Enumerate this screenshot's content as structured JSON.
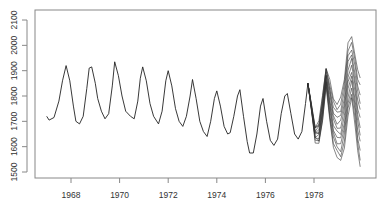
{
  "chart_data": {
    "type": "line",
    "title": "",
    "xlabel": "",
    "ylabel": "",
    "xlim": [
      1966.5,
      1980.3
    ],
    "ylim": [
      1500,
      2100
    ],
    "grid": false,
    "legend": null,
    "x_ticks": [
      "1968",
      "1970",
      "1972",
      "1974",
      "1976",
      "1978"
    ],
    "y_ticks": [
      "1500",
      "1600",
      "1700",
      "1800",
      "1900",
      "2000",
      "2100"
    ],
    "series": [
      {
        "name": "observed",
        "points": [
          [
            1967.0,
            1720
          ],
          [
            1967.1,
            1705
          ],
          [
            1967.3,
            1715
          ],
          [
            1967.5,
            1780
          ],
          [
            1967.65,
            1860
          ],
          [
            1967.8,
            1920
          ],
          [
            1967.95,
            1860
          ],
          [
            1968.1,
            1760
          ],
          [
            1968.2,
            1700
          ],
          [
            1968.35,
            1690
          ],
          [
            1968.5,
            1720
          ],
          [
            1968.65,
            1830
          ],
          [
            1968.75,
            1910
          ],
          [
            1968.85,
            1915
          ],
          [
            1969.0,
            1850
          ],
          [
            1969.1,
            1790
          ],
          [
            1969.25,
            1740
          ],
          [
            1969.4,
            1710
          ],
          [
            1969.55,
            1730
          ],
          [
            1969.7,
            1840
          ],
          [
            1969.8,
            1935
          ],
          [
            1969.95,
            1880
          ],
          [
            1970.1,
            1800
          ],
          [
            1970.25,
            1740
          ],
          [
            1970.45,
            1720
          ],
          [
            1970.6,
            1710
          ],
          [
            1970.75,
            1780
          ],
          [
            1970.85,
            1870
          ],
          [
            1970.95,
            1915
          ],
          [
            1971.1,
            1860
          ],
          [
            1971.25,
            1770
          ],
          [
            1971.4,
            1720
          ],
          [
            1971.6,
            1690
          ],
          [
            1971.75,
            1740
          ],
          [
            1971.9,
            1860
          ],
          [
            1972.0,
            1900
          ],
          [
            1972.15,
            1840
          ],
          [
            1972.3,
            1750
          ],
          [
            1972.45,
            1700
          ],
          [
            1972.6,
            1680
          ],
          [
            1972.75,
            1720
          ],
          [
            1972.9,
            1800
          ],
          [
            1973.0,
            1865
          ],
          [
            1973.15,
            1790
          ],
          [
            1973.3,
            1700
          ],
          [
            1973.45,
            1660
          ],
          [
            1973.6,
            1640
          ],
          [
            1973.75,
            1700
          ],
          [
            1973.9,
            1790
          ],
          [
            1974.0,
            1820
          ],
          [
            1974.15,
            1760
          ],
          [
            1974.3,
            1680
          ],
          [
            1974.45,
            1650
          ],
          [
            1974.55,
            1655
          ],
          [
            1974.7,
            1720
          ],
          [
            1974.85,
            1800
          ],
          [
            1974.95,
            1825
          ],
          [
            1975.1,
            1720
          ],
          [
            1975.25,
            1620
          ],
          [
            1975.35,
            1575
          ],
          [
            1975.5,
            1575
          ],
          [
            1975.65,
            1650
          ],
          [
            1975.8,
            1760
          ],
          [
            1975.9,
            1790
          ],
          [
            1976.05,
            1700
          ],
          [
            1976.2,
            1625
          ],
          [
            1976.35,
            1605
          ],
          [
            1976.5,
            1630
          ],
          [
            1976.65,
            1730
          ],
          [
            1976.8,
            1800
          ],
          [
            1976.9,
            1810
          ],
          [
            1977.05,
            1730
          ],
          [
            1977.2,
            1650
          ],
          [
            1977.35,
            1630
          ],
          [
            1977.5,
            1660
          ],
          [
            1977.65,
            1770
          ],
          [
            1977.75,
            1850
          ]
        ]
      }
    ],
    "forecast_fan": {
      "start_year": 1977.75,
      "start_value": 1850,
      "n_paths": 12,
      "x": [
        1977.75,
        1977.9,
        1978.05,
        1978.2,
        1978.35,
        1978.5,
        1978.65,
        1978.8,
        1978.95,
        1979.1,
        1979.25,
        1979.4,
        1979.55,
        1979.7,
        1979.8,
        1979.9
      ],
      "upper": [
        1850,
        1760,
        1680,
        1700,
        1800,
        1915,
        1860,
        1790,
        1770,
        1790,
        1870,
        2010,
        2030,
        1960,
        1900,
        1870
      ],
      "lower": [
        1850,
        1740,
        1620,
        1610,
        1700,
        1840,
        1700,
        1600,
        1560,
        1540,
        1600,
        1720,
        1790,
        1680,
        1580,
        1520
      ]
    }
  },
  "axes": {
    "x_labels": [
      "1968",
      "1970",
      "1972",
      "1974",
      "1976",
      "1978"
    ],
    "y_labels": [
      "1500",
      "1600",
      "1700",
      "1800",
      "1900",
      "2000",
      "2100"
    ]
  }
}
